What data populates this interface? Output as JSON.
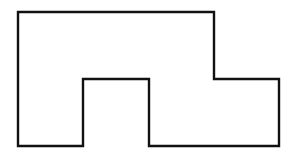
{
  "diagram": {
    "type": "rectilinear-polygon-outline",
    "background": "#ffffff",
    "stroke_color": "#111111",
    "stroke_width": 2.4,
    "fill": "none",
    "points": "18,12 214,12 214,79 279,79 279,146 149,146 149,79 83,79 83,146 18,146"
  }
}
